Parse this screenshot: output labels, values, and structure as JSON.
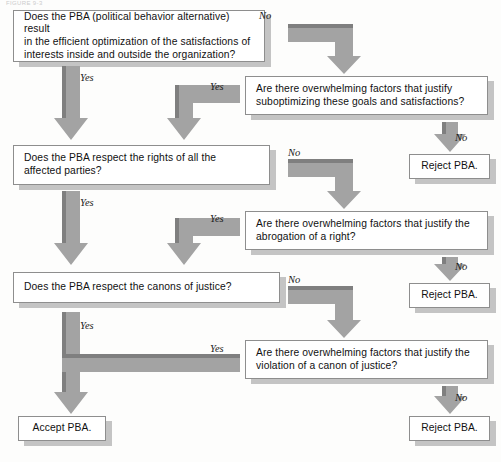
{
  "figure": {
    "caption": "FIGURE 9-3",
    "width": 501,
    "height": 462
  },
  "colors": {
    "arrow_fill": "#a0a0a0",
    "arrow_edge_dark": "#7d7d7d",
    "box_fill": "#ffffff",
    "box_border": "#8e8e8e",
    "box_shadow": "#bdbdbd",
    "text": "#111111",
    "background": "#fdfdfc"
  },
  "nodes": [
    {
      "id": "q1",
      "kind": "question",
      "text": "Does the PBA (political behavior alternative) result\nin the efficient optimization of the satisfactions of\ninterests inside and outside the organization?",
      "align": "left",
      "x": 13,
      "y": 10,
      "w": 252,
      "h": 52
    },
    {
      "id": "e1",
      "kind": "exception",
      "text": "Are there overwhelming factors that justify\nsuboptimizing these goals and satisfactions?",
      "align": "left",
      "x": 245,
      "y": 76,
      "w": 243,
      "h": 39
    },
    {
      "id": "r1",
      "kind": "terminal-reject",
      "text": "Reject PBA.",
      "align": "center",
      "x": 409,
      "y": 154,
      "w": 81,
      "h": 25
    },
    {
      "id": "q2",
      "kind": "question",
      "text": "Does the PBA respect the rights of all the\naffected parties?",
      "align": "left",
      "x": 13,
      "y": 145,
      "w": 257,
      "h": 40
    },
    {
      "id": "e2",
      "kind": "exception",
      "text": "Are there overwhelming factors that justify the\nabrogation of a right?",
      "align": "left",
      "x": 245,
      "y": 211,
      "w": 243,
      "h": 39
    },
    {
      "id": "r2",
      "kind": "terminal-reject",
      "text": "Reject PBA.",
      "align": "center",
      "x": 409,
      "y": 283,
      "w": 81,
      "h": 25
    },
    {
      "id": "q3",
      "kind": "question",
      "text": "Does the PBA respect the canons of justice?",
      "align": "left",
      "x": 13,
      "y": 272,
      "w": 267,
      "h": 31
    },
    {
      "id": "e3",
      "kind": "exception",
      "text": "Are there overwhelming factors that justify the\nviolation of a canon of justice?",
      "align": "left",
      "x": 245,
      "y": 340,
      "w": 243,
      "h": 39
    },
    {
      "id": "r3",
      "kind": "terminal-reject",
      "text": "Reject PBA.",
      "align": "center",
      "x": 409,
      "y": 416,
      "w": 81,
      "h": 25
    },
    {
      "id": "a1",
      "kind": "terminal-accept",
      "text": "Accept PBA.",
      "align": "center",
      "x": 18,
      "y": 416,
      "w": 88,
      "h": 25
    }
  ],
  "edge_labels": [
    {
      "id": "lbl-no-1",
      "text": "No",
      "x": 259,
      "y": 10
    },
    {
      "id": "lbl-yes-1",
      "text": "Yes",
      "x": 80,
      "y": 72
    },
    {
      "id": "lbl-yes-e1",
      "text": "Yes",
      "x": 210,
      "y": 81
    },
    {
      "id": "lbl-no-r1",
      "text": "No",
      "x": 455,
      "y": 132
    },
    {
      "id": "lbl-no-2",
      "text": "No",
      "x": 288,
      "y": 147
    },
    {
      "id": "lbl-yes-2",
      "text": "Yes",
      "x": 80,
      "y": 197
    },
    {
      "id": "lbl-yes-e2",
      "text": "Yes",
      "x": 210,
      "y": 213
    },
    {
      "id": "lbl-no-r2",
      "text": "No",
      "x": 455,
      "y": 261
    },
    {
      "id": "lbl-no-3",
      "text": "No",
      "x": 288,
      "y": 274
    },
    {
      "id": "lbl-yes-3",
      "text": "Yes",
      "x": 80,
      "y": 320
    },
    {
      "id": "lbl-yes-e3",
      "text": "Yes",
      "x": 210,
      "y": 343
    },
    {
      "id": "lbl-no-r3",
      "text": "No",
      "x": 455,
      "y": 392
    }
  ],
  "connectors": [
    {
      "id": "arrow-q1-yes-to-q2",
      "type": "down-arrow",
      "from": "q1",
      "to": "q2",
      "label": "Yes"
    },
    {
      "id": "arrow-q1-no-to-e1",
      "type": "elbow-right-down",
      "from": "q1",
      "to": "e1",
      "label": "No"
    },
    {
      "id": "arrow-e1-yes-to-q2",
      "type": "elbow-left-down",
      "from": "e1",
      "to": "q2",
      "label": "Yes"
    },
    {
      "id": "arrow-e1-no-to-r1",
      "type": "down-arrow",
      "from": "e1",
      "to": "r1",
      "label": "No"
    },
    {
      "id": "arrow-q2-yes-to-q3",
      "type": "down-arrow",
      "from": "q2",
      "to": "q3",
      "label": "Yes"
    },
    {
      "id": "arrow-q2-no-to-e2",
      "type": "elbow-right-down",
      "from": "q2",
      "to": "e2",
      "label": "No"
    },
    {
      "id": "arrow-e2-yes-to-q3",
      "type": "elbow-left-down",
      "from": "e2",
      "to": "q3",
      "label": "Yes"
    },
    {
      "id": "arrow-e2-no-to-r2",
      "type": "down-arrow",
      "from": "e2",
      "to": "r2",
      "label": "No"
    },
    {
      "id": "arrow-q3-yes-to-a1",
      "type": "down-arrow-long",
      "from": "q3",
      "to": "a1",
      "label": "Yes"
    },
    {
      "id": "arrow-q3-no-to-e3",
      "type": "elbow-right-down",
      "from": "q3",
      "to": "e3",
      "label": "No"
    },
    {
      "id": "arrow-e3-yes-to-a1",
      "type": "long-horizontal-merge",
      "from": "e3",
      "to": "a1",
      "label": "Yes"
    },
    {
      "id": "arrow-e3-no-to-r3",
      "type": "down-arrow",
      "from": "e3",
      "to": "r3",
      "label": "No"
    }
  ]
}
